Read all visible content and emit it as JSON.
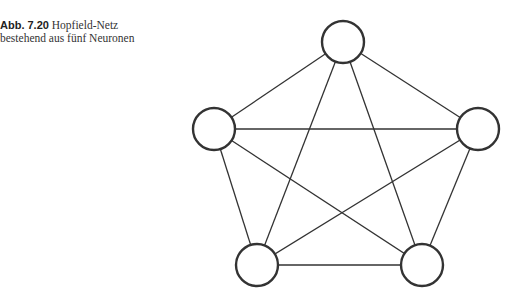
{
  "caption": {
    "label": "Abb. 7.20",
    "text_line1": "Hopfield-Netz",
    "text_line2": "bestehend aus fünf Neuronen"
  },
  "diagram": {
    "type": "fully-connected graph",
    "nodes": [
      {
        "id": "top",
        "x": 343,
        "y": 42
      },
      {
        "id": "left",
        "x": 214,
        "y": 129
      },
      {
        "id": "right",
        "x": 478,
        "y": 129
      },
      {
        "id": "bottom-left",
        "x": 257,
        "y": 265
      },
      {
        "id": "bottom-right",
        "x": 422,
        "y": 265
      }
    ],
    "node_radius": 21,
    "edges": [
      [
        "top",
        "left"
      ],
      [
        "top",
        "right"
      ],
      [
        "top",
        "bottom-left"
      ],
      [
        "top",
        "bottom-right"
      ],
      [
        "left",
        "right"
      ],
      [
        "left",
        "bottom-left"
      ],
      [
        "left",
        "bottom-right"
      ],
      [
        "right",
        "bottom-left"
      ],
      [
        "right",
        "bottom-right"
      ],
      [
        "bottom-left",
        "bottom-right"
      ]
    ],
    "colors": {
      "stroke": "#333333",
      "fill": "#ffffff"
    }
  }
}
